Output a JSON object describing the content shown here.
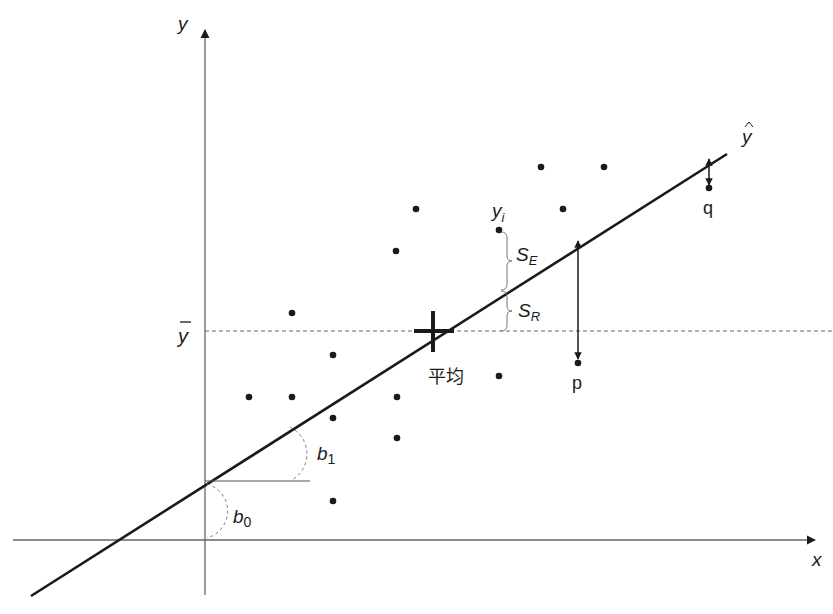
{
  "diagram": {
    "title": "",
    "type": "linear regression illustration",
    "axes": {
      "x_label": "x",
      "y_label": "y",
      "origin": [
        205,
        540
      ],
      "y_axis": {
        "x": 205,
        "y_top": 27,
        "y_bottom": 595
      },
      "x_axis": {
        "y": 540,
        "x_left": 13,
        "x_right": 818
      }
    },
    "regression_line": {
      "label": "ŷ",
      "start": [
        31,
        596
      ],
      "end": [
        727,
        154
      ],
      "color": "#1a1a1a"
    },
    "mean_line": {
      "label": "ȳ",
      "y": 331,
      "x_start": 205,
      "x_end": 833,
      "style": "dashed"
    },
    "mean_point": {
      "label": "平均",
      "x": 433,
      "y": 331
    },
    "intercept": {
      "label": "b0",
      "label_main": "b",
      "label_sub": "0",
      "x": 205,
      "y": 481
    },
    "slope": {
      "label": "b1",
      "label_main": "b",
      "label_sub": "1",
      "horizontal_ref_end_x": 310
    },
    "yi_point": {
      "label_main": "y",
      "label_sub": "i",
      "x": 499,
      "y": 230
    },
    "braces": [
      {
        "label_main": "S",
        "label_sub": "E",
        "y_top": 230,
        "y_bottom": 290,
        "x": 505
      },
      {
        "label_main": "S",
        "label_sub": "R",
        "y_top": 290,
        "y_bottom": 331,
        "x": 505
      }
    ],
    "residual_markers": [
      {
        "label": "p",
        "x": 578,
        "y_line": 238,
        "y_point": 363
      },
      {
        "label": "q",
        "x": 709,
        "y_line": 157,
        "y_point": 188
      }
    ],
    "data_points": [
      [
        292,
        313
      ],
      [
        249,
        397
      ],
      [
        292,
        397
      ],
      [
        333,
        355
      ],
      [
        333,
        418
      ],
      [
        397,
        397
      ],
      [
        397,
        438
      ],
      [
        333,
        501
      ],
      [
        396,
        251
      ],
      [
        416,
        209
      ],
      [
        499,
        230
      ],
      [
        499,
        376
      ],
      [
        541,
        167
      ],
      [
        563,
        209
      ],
      [
        604,
        167
      ],
      [
        709,
        188
      ],
      [
        578,
        363
      ]
    ],
    "colors": {
      "ink": "#1a1a1a",
      "axis": "#555555",
      "dashed": "#666666",
      "background": "#ffffff"
    }
  }
}
